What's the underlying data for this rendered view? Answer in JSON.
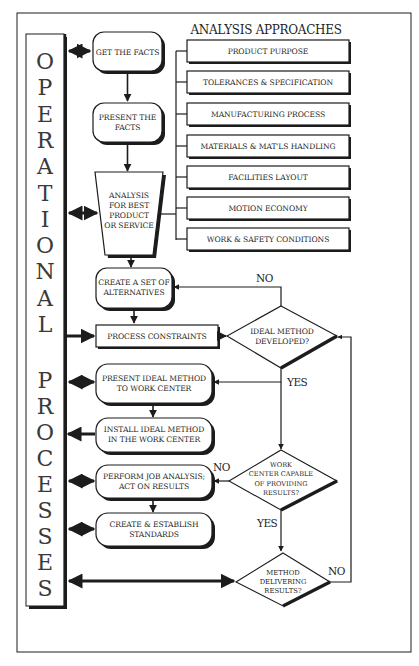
{
  "diagram": {
    "side_title": {
      "word1": [
        "O",
        "P",
        "E",
        "R",
        "A",
        "T",
        "I",
        "O",
        "N",
        "A",
        "L"
      ],
      "word2": [
        "P",
        "R",
        "O",
        "C",
        "E",
        "S",
        "S",
        "E",
        "S"
      ]
    },
    "analysis_approaches": {
      "heading": "ANALYSIS APPROACHES",
      "items": [
        "PRODUCT PURPOSE",
        "TOLERANCES & SPECIFICATION",
        "MANUFACTURING PROCESS",
        "MATERIALS & MAT'LS HANDLING",
        "FACILITIES LAYOUT",
        "MOTION ECONOMY",
        "WORK & SAFETY CONDITIONS"
      ]
    },
    "steps": {
      "get_facts": [
        "GET THE FACTS"
      ],
      "present_facts": [
        "PRESENT THE",
        "FACTS"
      ],
      "analysis": [
        "ANALYSIS",
        "FOR BEST",
        "PRODUCT",
        "OR SERVICE"
      ],
      "create_alternatives": [
        "CREATE A SET OF",
        "ALTERNATIVES"
      ],
      "process_constraints": [
        "PROCESS CONSTRAINTS"
      ],
      "present_ideal": [
        "PRESENT IDEAL METHOD",
        "TO WORK CENTER"
      ],
      "install_ideal": [
        "INSTALL  IDEAL METHOD",
        "IN THE WORK CENTER"
      ],
      "perform_job": [
        "PERFORM JOB ANALYSIS;",
        "ACT ON RESULTS"
      ],
      "create_standards": [
        "CREATE & ESTABLISH",
        "STANDARDS"
      ]
    },
    "decisions": {
      "ideal_method": {
        "lines": [
          "IDEAL METHOD",
          "DEVELOPED?"
        ],
        "no": "NO",
        "yes": "YES"
      },
      "work_center": {
        "lines": [
          "WORK",
          "CENTER CAPABLE",
          "OF PROVIDING",
          "RESULTS?"
        ],
        "no": "NO",
        "yes": "YES"
      },
      "method_delivering": {
        "lines": [
          "METHOD",
          "DELIVERING",
          "RESULTS?"
        ],
        "no": "NO"
      }
    },
    "colors": {
      "ink": "#1c1c1c",
      "paper": "#ffffff",
      "shadow": "#1c1c1c"
    }
  }
}
